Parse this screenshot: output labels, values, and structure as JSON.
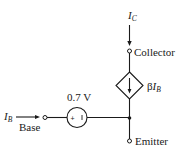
{
  "diagram": {
    "collector": {
      "current_symbol": "I",
      "current_subscript": "C",
      "terminal_label": "Collector"
    },
    "base": {
      "current_symbol": "I",
      "current_subscript": "B",
      "terminal_label": "Base"
    },
    "emitter": {
      "terminal_label": "Emitter"
    },
    "voltage_source": {
      "value_label": "0.7 V",
      "plus_sign": "+",
      "minus_sign": "−"
    },
    "dependent_current_source": {
      "gain_symbol": "β",
      "current_symbol": "I",
      "current_subscript": "B"
    },
    "colors": {
      "line": "#1a1a1a",
      "background": "#ffffff"
    }
  }
}
